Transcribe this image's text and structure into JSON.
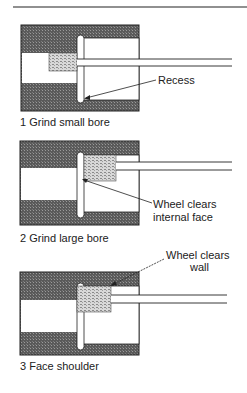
{
  "figure": {
    "panels": [
      {
        "number": "1",
        "caption": "1 Grind small bore",
        "callout": [
          "Recess"
        ]
      },
      {
        "number": "2",
        "caption": "2 Grind large bore",
        "callout": [
          "Wheel clears",
          "internal face"
        ]
      },
      {
        "number": "3",
        "caption": "3 Face shoulder",
        "callout": [
          "Wheel clears",
          "wall"
        ]
      }
    ]
  },
  "colors": {
    "hatch_dark": "#4a4a4a",
    "hatch_light": "#8a8a8a",
    "wheel_fill": "#c8c8c8",
    "line": "#222222"
  }
}
